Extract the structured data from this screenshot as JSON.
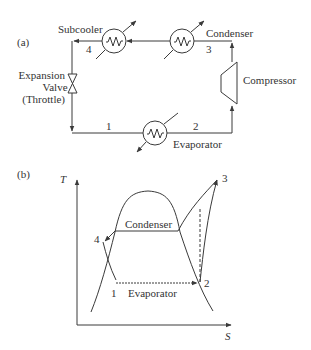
{
  "part_a": {
    "label": "(a)",
    "components": {
      "subcooler": "Subcooler",
      "condenser": "Condenser",
      "compressor": "Compressor",
      "evaporator": "Evaporator",
      "valve_line1": "Expansion",
      "valve_line2": "Valve",
      "valve_line3": "(Throttle)"
    },
    "states": {
      "s1": "1",
      "s2": "2",
      "s3": "3",
      "s4": "4"
    }
  },
  "part_b": {
    "label": "(b)",
    "axes": {
      "y": "T",
      "x": "S"
    },
    "process_labels": {
      "condenser": "Condenser",
      "evaporator": "Evaporator"
    },
    "states": {
      "s1": "1",
      "s2": "2",
      "s3": "3",
      "s4": "4"
    }
  },
  "colors": {
    "line": "#3a3a3a",
    "text": "#333333",
    "background": "#ffffff"
  }
}
